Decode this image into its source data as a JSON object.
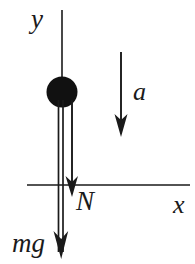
{
  "diagram": {
    "type": "free-body-diagram",
    "background_color": "#ffffff",
    "stroke_color": "#1a1a1a",
    "axes": {
      "y_axis": {
        "label": "y",
        "orientation": "vertical",
        "direction": "up",
        "x": 62,
        "y_top": 10,
        "y_bottom": 258
      },
      "x_axis": {
        "label": "x",
        "orientation": "horizontal",
        "direction": "right",
        "y": 185,
        "x_left": 27,
        "x_right": 190
      },
      "origin": {
        "x": 62,
        "y": 185
      }
    },
    "body": {
      "name": "ball",
      "shape": "filled-circle",
      "fill": "#111111",
      "center_x": 62,
      "center_y": 92,
      "radius": 15
    },
    "vectors": [
      {
        "label": "a",
        "meaning": "acceleration",
        "direction": "down",
        "x": 121,
        "y_start": 52,
        "y_end": 137,
        "label_x": 133,
        "label_y": 79
      },
      {
        "label": "N",
        "meaning": "normal force",
        "direction": "down",
        "x": 72,
        "y_start": 100,
        "y_end": 197,
        "label_x": 76,
        "label_y": 188
      },
      {
        "label": "mg",
        "meaning": "weight",
        "direction": "down",
        "x": 61,
        "y_start": 100,
        "y_end": 259,
        "label_x": 12,
        "label_y": 230
      }
    ]
  }
}
